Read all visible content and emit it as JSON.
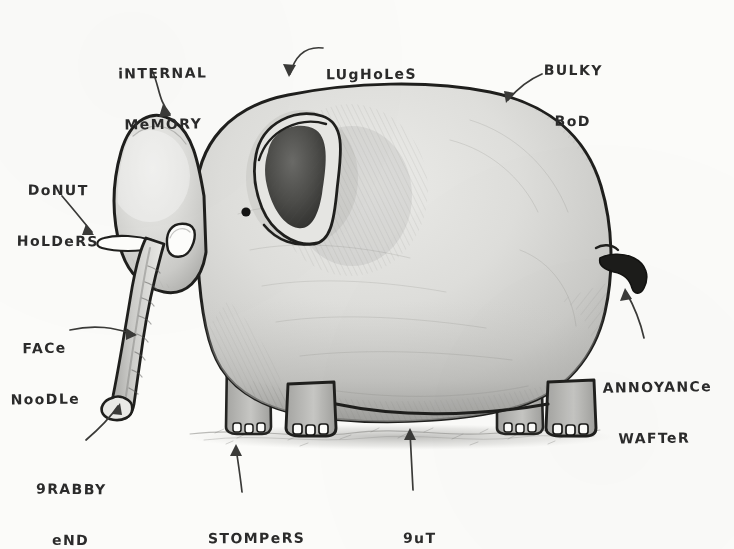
{
  "diagram": {
    "style": "hand-drawn pencil and ink sketch",
    "background_color": "#fbfbf9",
    "ink_color": "#2b2b2b",
    "body_fill_light": "#e4e4e1",
    "body_fill_mid": "#d2d2cf",
    "body_fill_dark": "#b4b4b1",
    "ear_fill": "#4a4a48",
    "tusk_fill": "#fcfcfa",
    "ground_color": "#9a9a97"
  },
  "labels": [
    {
      "id": "internal-memory",
      "line1": "iNTERNAL",
      "line2": "MeMORY",
      "arrow": "curved-down-right"
    },
    {
      "id": "lugholes",
      "line1": "LUgHoLeS",
      "line2": "",
      "arrow": "curved-down-left"
    },
    {
      "id": "bulky-bod",
      "line1": "BULKY",
      "line2": "BoD",
      "arrow": "curved-down-left"
    },
    {
      "id": "donut-holders",
      "line1": "DoNUT",
      "line2": "HoLDeRS",
      "arrow": "curved-down-right"
    },
    {
      "id": "face-noodle",
      "line1": "FACe",
      "line2": "NooDLe",
      "arrow": "straight-right"
    },
    {
      "id": "grabby-end",
      "line1": "9RABBY",
      "line2": "eND",
      "arrow": "curved-up-right"
    },
    {
      "id": "stompers",
      "line1": "STOMPeRS",
      "line2": "",
      "arrow": "curved-up"
    },
    {
      "id": "gut",
      "line1": "9uT",
      "line2": "",
      "arrow": "straight-up"
    },
    {
      "id": "annoyance-wafter",
      "line1": "ANNOYANCe",
      "line2": "WAFTeR",
      "arrow": "curved-up-left"
    }
  ],
  "parts": {
    "body": "bulky-bod",
    "head": "internal-memory",
    "ear": "lugholes",
    "tusks": "donut-holders",
    "trunk": "face-noodle",
    "trunk_tip": "grabby-end",
    "feet": "stompers",
    "belly": "gut",
    "tail": "annoyance-wafter"
  }
}
